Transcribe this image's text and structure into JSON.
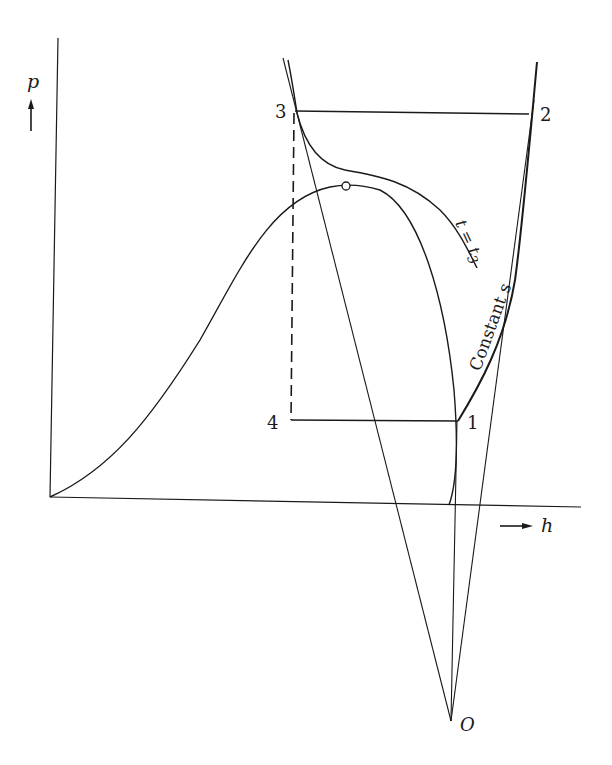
{
  "diagram": {
    "type": "p-h diagram (vapor-compression refrigeration cycle)",
    "axes": {
      "y_label": "p",
      "x_label": "h",
      "y_arrow": "up-arrow",
      "x_arrow": "right-arrow"
    },
    "points": [
      {
        "id": "1",
        "label": "1"
      },
      {
        "id": "2",
        "label": "2"
      },
      {
        "id": "3",
        "label": "3"
      },
      {
        "id": "4",
        "label": "4"
      },
      {
        "id": "O",
        "label": "O"
      }
    ],
    "curve_labels": {
      "isotherm": "t = t",
      "isotherm_subscript": "3",
      "isentrope": "Constant s"
    },
    "elements": [
      "saturation-dome with critical point marker",
      "isotherm t = t3 through point 3",
      "constant entropy line from 1 to 2",
      "condensation line 3-2 (horizontal, high pressure)",
      "evaporation line 4-1 (horizontal, low pressure)",
      "throttling line 3-4 (dashed vertical, constant h)",
      "construction rays from origin O through points 3, 1 and 2"
    ],
    "colors": {
      "ink": "#1a1a1a",
      "background": "#ffffff"
    }
  }
}
